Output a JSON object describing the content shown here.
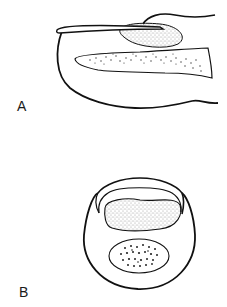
{
  "figure": {
    "panels": [
      {
        "label": "A",
        "description": "lateral view drawing"
      },
      {
        "label": "B",
        "description": "frontal view drawing"
      }
    ],
    "colors": {
      "stroke": "#111111",
      "stipple": "#333333",
      "background": "#ffffff"
    }
  }
}
